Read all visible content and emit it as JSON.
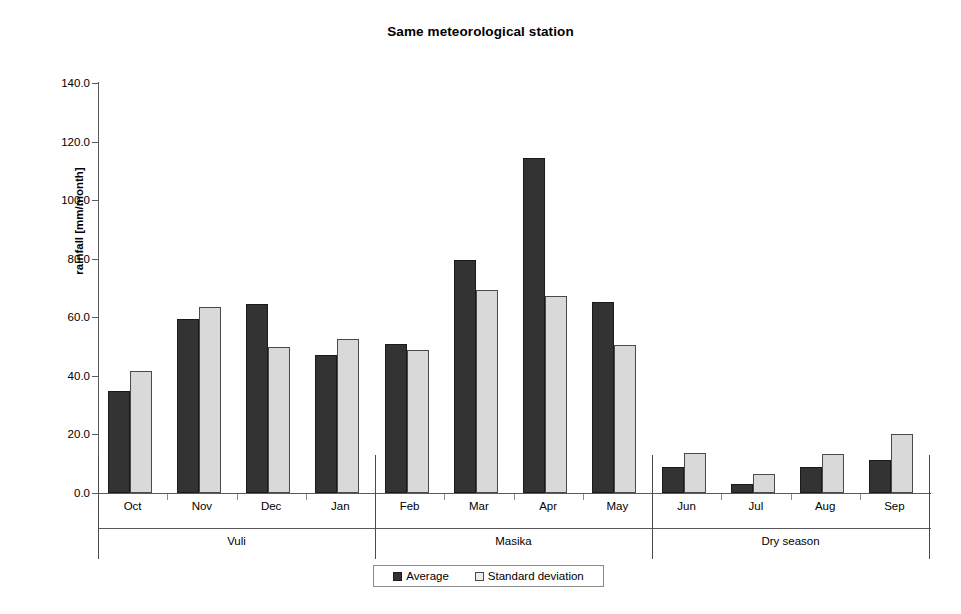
{
  "chart_data": {
    "type": "bar",
    "title": "Same meteorological station",
    "xlabel": "",
    "ylabel": "rainfall [mm/month]",
    "ylim": [
      0.0,
      140.0
    ],
    "ytick_step": 20.0,
    "ytick_labels": [
      "0.0",
      "20.0",
      "40.0",
      "60.0",
      "80.0",
      "100.0",
      "120.0",
      "140.0"
    ],
    "ytick_values": [
      0.0,
      20.0,
      40.0,
      60.0,
      80.0,
      100.0,
      120.0,
      140.0
    ],
    "grid": false,
    "legend_position": "bottom-center",
    "categories": [
      "Oct",
      "Nov",
      "Dec",
      "Jan",
      "Feb",
      "Mar",
      "Apr",
      "May",
      "Jun",
      "Jul",
      "Aug",
      "Sep"
    ],
    "series": [
      {
        "name": "Average",
        "color": "#333333",
        "values": [
          34.8,
          59.5,
          64.5,
          47.0,
          50.8,
          79.5,
          114.5,
          65.2,
          8.8,
          3.0,
          8.9,
          11.3
        ]
      },
      {
        "name": "Standard deviation",
        "color": "#d9d9d9",
        "values": [
          41.8,
          63.5,
          49.7,
          52.6,
          48.8,
          69.2,
          67.4,
          50.6,
          13.5,
          6.5,
          13.4,
          20.1
        ]
      }
    ],
    "group_labels": [
      "Vuli",
      "Masika",
      "Dry season"
    ],
    "groups": [
      {
        "label": "Vuli",
        "months": [
          "Oct",
          "Nov",
          "Dec",
          "Jan"
        ]
      },
      {
        "label": "Masika",
        "months": [
          "Feb",
          "Mar",
          "Apr",
          "May"
        ]
      },
      {
        "label": "Dry season",
        "months": [
          "Jun",
          "Jul",
          "Aug",
          "Sep"
        ]
      }
    ]
  },
  "legend": {
    "entries": [
      {
        "label": "Average",
        "swatch": "avg"
      },
      {
        "label": "Standard deviation",
        "swatch": "std"
      }
    ]
  },
  "colors": {
    "average": "#333333",
    "standard_deviation": "#d9d9d9",
    "axis": "#5a5a5a",
    "background": "#ffffff"
  }
}
